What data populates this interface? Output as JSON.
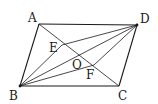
{
  "figure": {
    "type": "geometry",
    "points": {
      "A": {
        "label": "A",
        "x": 39,
        "y": 24
      },
      "B": {
        "label": "B",
        "x": 20,
        "y": 86
      },
      "C": {
        "label": "C",
        "x": 119,
        "y": 86
      },
      "D": {
        "label": "D",
        "x": 137,
        "y": 25
      },
      "E": {
        "label": "E",
        "x": 62,
        "y": 45
      },
      "O": {
        "label": "O",
        "x": 78,
        "y": 55
      },
      "F": {
        "label": "F",
        "x": 94,
        "y": 65
      }
    },
    "segments": [
      "AB",
      "BC",
      "CD",
      "DA",
      "AC",
      "BD",
      "BE",
      "ED",
      "DF",
      "FB"
    ],
    "labels": {
      "A": "A",
      "B": "B",
      "C": "C",
      "D": "D",
      "E": "E",
      "O": "O",
      "F": "F"
    }
  }
}
